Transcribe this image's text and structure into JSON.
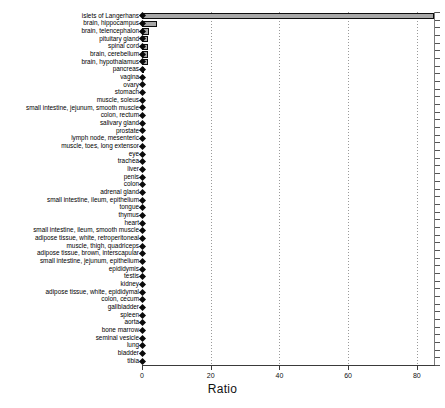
{
  "chart_data": {
    "type": "bar",
    "orientation": "horizontal",
    "title": "",
    "xlabel": "Ratio",
    "ylabel": "",
    "xlim": [
      0,
      85
    ],
    "axis_max_tick": 80,
    "xticks": [
      0,
      20,
      40,
      60,
      80
    ],
    "xticklabels": [
      "0",
      "20",
      "40",
      "60",
      "80"
    ],
    "grid": "vertical-dotted",
    "legend": "none",
    "bar_color": "#a8a8a8",
    "bar_edge_color": "#0d0d0d",
    "marker_color": "#0a0a0a",
    "marker_shape": "diamond",
    "categories": [
      "islets of Langerhans",
      "brain, hippocampus",
      "brain, telencephalon",
      "pituitary gland",
      "spinal cord",
      "brain, cerebellum",
      "brain, hypothalamus",
      "pancreas",
      "vagina",
      "ovary",
      "stomach",
      "muscle, soleus",
      "small intestine, jejunum, smooth muscle",
      "colon, rectum",
      "salivary gland",
      "prostate",
      "lymph node, mesenteric",
      "muscle, toes, long extensor",
      "eye",
      "trachea",
      "liver",
      "penis",
      "colon",
      "adrenal gland",
      "small intestine, ileum, epithelium",
      "tongue",
      "thymus",
      "heart",
      "small intestine, ileum, smooth muscle",
      "adipose tissue, white, retroperitoneal",
      "muscle, thigh, quadriceps",
      "adipose tissue, brown, interscapular",
      "small intestine, jejunum, epithelium",
      "epididymis",
      "testis",
      "kidney",
      "adipose tissue, white, epididymal",
      "colon, cecum",
      "gallbladder",
      "spleen",
      "aorta",
      "bone marrow",
      "seminal vesicle",
      "lung",
      "bladder",
      "tibia"
    ],
    "values": [
      85.0,
      4.3,
      1.9,
      1.8,
      1.8,
      1.7,
      1.7,
      0.35,
      0.3,
      0.3,
      0.3,
      0.3,
      0.3,
      0.28,
      0.28,
      0.25,
      0.25,
      0.25,
      0.22,
      0.22,
      0.22,
      0.2,
      0.2,
      0.2,
      0.2,
      0.2,
      0.2,
      0.18,
      0.18,
      0.18,
      0.18,
      0.18,
      0.18,
      0.16,
      0.16,
      0.16,
      0.15,
      0.15,
      0.15,
      0.14,
      0.14,
      0.14,
      0.12,
      0.12,
      0.1,
      0.1
    ]
  }
}
